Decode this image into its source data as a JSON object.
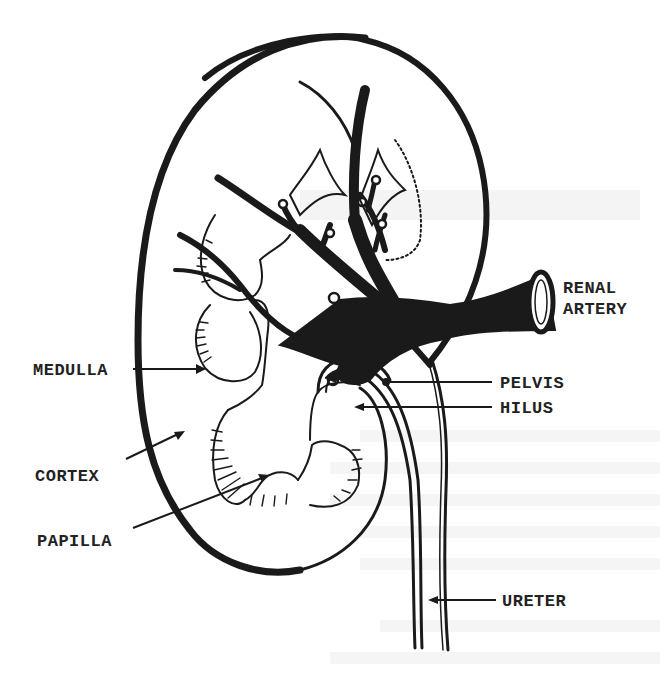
{
  "figure": {
    "colors": {
      "ink": "#1a1a1a",
      "label_text": "#222222",
      "background": "#ffffff",
      "bleed_through": "#ececec"
    }
  },
  "labels": {
    "renal_artery_line1": "RENAL",
    "renal_artery_line2": "ARTERY",
    "medulla": "MEDULLA",
    "pelvis": "PELVIS",
    "hilus": "HILUS",
    "cortex": "CORTEX",
    "papilla": "PAPILLA",
    "ureter": "URETER"
  }
}
